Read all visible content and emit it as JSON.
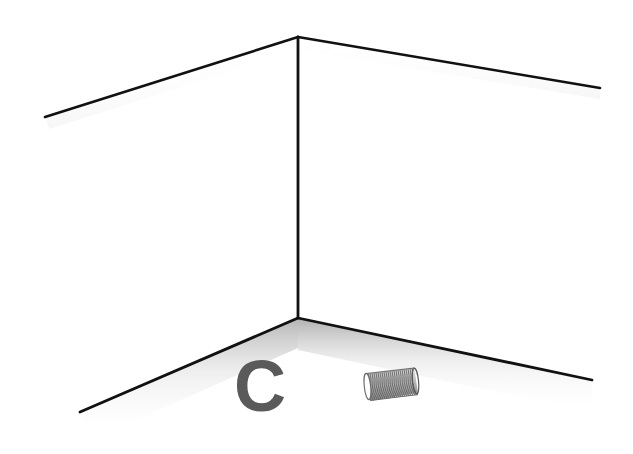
{
  "scene": {
    "title": "Room corner with letter C and coil spring",
    "width": 633,
    "height": 454,
    "background_color": "#ffffff",
    "line_color": "#111111"
  },
  "room": {
    "description": "Interior corner of a room drawn in simple black outline, two walls meeting at a vertical edge with ceiling and floor lines receding to the left and right",
    "corner_top": {
      "x": 298,
      "y": 37
    },
    "corner_bottom": {
      "x": 298,
      "y": 318
    },
    "ceiling_left_end": {
      "x": 45,
      "y": 117
    },
    "ceiling_right_end": {
      "x": 600,
      "y": 88
    },
    "floor_left_end": {
      "x": 80,
      "y": 412
    },
    "floor_right_end": {
      "x": 592,
      "y": 380
    },
    "wall_color": "#ffffff",
    "shadow_color": "#b8b8b8"
  },
  "objects": [
    {
      "name": "letter-c",
      "label": "C",
      "kind": "text-glyph",
      "color": "#5a5a5a",
      "position": {
        "x": 234,
        "y": 363
      },
      "size": {
        "width": 50,
        "height": 48
      }
    },
    {
      "name": "coil-spring",
      "label": "coil spring",
      "kind": "object",
      "color": "#9a9a9a",
      "position": {
        "x": 365,
        "y": 368
      },
      "size": {
        "width": 52,
        "height": 38
      },
      "coil_count": 26
    }
  ]
}
